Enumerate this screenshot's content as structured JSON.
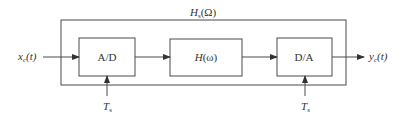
{
  "diagram": {
    "outer_system": {
      "label_main": "H",
      "label_sub": "s",
      "label_arg": "(Ω)"
    },
    "input": {
      "label_main": "x",
      "label_sub": "c",
      "label_arg": "(t)"
    },
    "output": {
      "label_main": "y",
      "label_sub": "c",
      "label_arg": "(t)"
    },
    "blocks": [
      {
        "id": "adc",
        "label": "A/D"
      },
      {
        "id": "filter",
        "label_main": "H",
        "label_arg": "(ω)"
      },
      {
        "id": "dac",
        "label": "D/A"
      }
    ],
    "clock_inputs": [
      {
        "label_main": "T",
        "label_sub": "s"
      },
      {
        "label_main": "T",
        "label_sub": "s"
      }
    ],
    "colors": {
      "stroke": "#4a4a4a",
      "text": "#333333",
      "background": "#ffffff"
    }
  }
}
